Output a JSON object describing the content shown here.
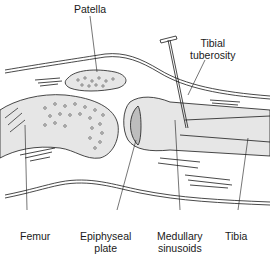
{
  "diagram": {
    "labels": {
      "patella": "Patella",
      "tibial_tuberosity_line1": "Tibial",
      "tibial_tuberosity_line2": "tuberosity",
      "femur": "Femur",
      "epiphyseal_line1": "Epiphyseal",
      "epiphyseal_line2": "plate",
      "medullary_line1": "Medullary",
      "medullary_line2": "sinusoids",
      "tibia": "Tibia"
    },
    "colors": {
      "line": "#1a1a1a",
      "bone_fill": "#e6e6e6",
      "background": "#ffffff"
    }
  }
}
